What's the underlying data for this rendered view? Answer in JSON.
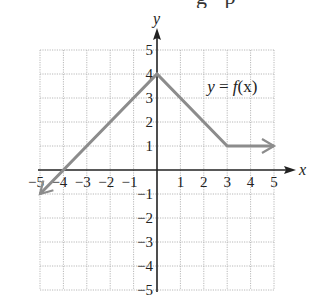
{
  "page": {
    "cropped_top_text_fragment": "g p"
  },
  "chart_data": {
    "type": "line",
    "title": "",
    "xlabel": "x",
    "ylabel": "y",
    "xlim": [
      -5,
      5
    ],
    "ylim": [
      -5,
      5
    ],
    "grid": true,
    "x_ticks": [
      "-5",
      "-4",
      "-3",
      "-2",
      "-1",
      "1",
      "2",
      "3",
      "4",
      "5"
    ],
    "y_ticks": [
      "5",
      "4",
      "3",
      "2",
      "1",
      "-1",
      "-2",
      "-3",
      "-4",
      "-5"
    ],
    "annotations": [
      {
        "text": "y = f(x)",
        "x": 2.4,
        "y": 3.5
      }
    ],
    "series": [
      {
        "name": "y = f(x)",
        "color": "#8c8c8c",
        "points": [
          [
            -5,
            -1
          ],
          [
            0,
            4
          ],
          [
            3,
            1
          ],
          [
            5,
            1
          ]
        ],
        "left_arrow": true,
        "right_arrow": true
      }
    ]
  },
  "labels": {
    "x_axis": "x",
    "y_axis": "y",
    "function": {
      "y": "y",
      "eq": " = ",
      "f": "f",
      "arg": "(x)"
    }
  }
}
